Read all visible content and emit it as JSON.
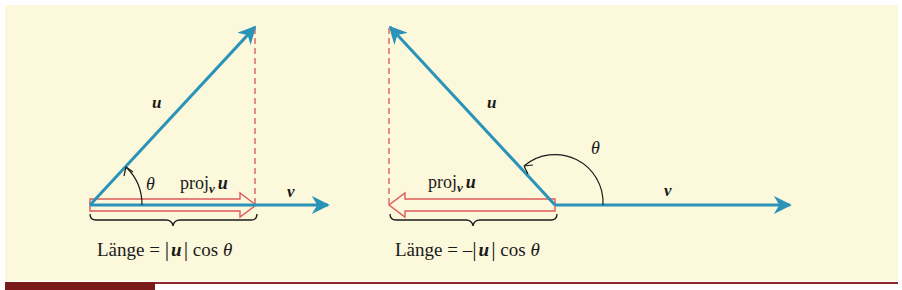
{
  "colors": {
    "background": "#FBF8DC",
    "vector": "#2A93B8",
    "projection": "#E05A5A",
    "dashed": "#D9534F",
    "ink": "#1a1a1a",
    "footer_bar": "#7A1A1A",
    "footer_line": "#8B2A2A"
  },
  "left_panel": {
    "u_label": "u",
    "v_label": "v",
    "theta_label": "θ",
    "proj_label_main": "proj",
    "proj_label_sub": "v",
    "proj_label_vec": "u",
    "length_prefix": "Länge = ",
    "length_bar_left": "|",
    "length_vec": "u",
    "length_bar_right": "|",
    "length_suffix": " cos ",
    "length_theta": "θ"
  },
  "right_panel": {
    "u_label": "u",
    "v_label": "v",
    "theta_label": "θ",
    "proj_label_main": "proj",
    "proj_label_sub": "v",
    "proj_label_vec": "u",
    "length_prefix": "Länge = –",
    "length_bar_left": "|",
    "length_vec": "u",
    "length_bar_right": "|",
    "length_suffix": " cos ",
    "length_theta": "θ"
  }
}
